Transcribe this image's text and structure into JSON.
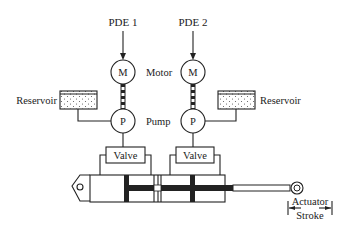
{
  "diagram": {
    "inputs": [
      {
        "id": "pde1",
        "label": "PDE 1"
      },
      {
        "id": "pde2",
        "label": "PDE 2"
      }
    ],
    "motor": {
      "symbol": "M",
      "label": "Motor"
    },
    "pump": {
      "symbol": "P",
      "label": "Pump"
    },
    "reservoirs": [
      {
        "side": "left",
        "label": "Reservoir"
      },
      {
        "side": "right",
        "label": "Reservoir"
      }
    ],
    "valves": [
      {
        "side": "left",
        "label": "Valve"
      },
      {
        "side": "right",
        "label": "Valve"
      }
    ],
    "actuator": {
      "stroke_label_line1": "Actuator",
      "stroke_label_line2": "Stroke"
    },
    "colors": {
      "line": "#222222",
      "background": "#ffffff"
    }
  }
}
